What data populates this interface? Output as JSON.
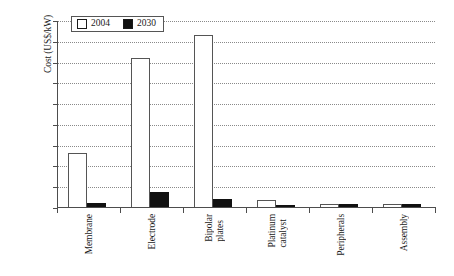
{
  "chart_data": {
    "type": "bar",
    "title": "",
    "xlabel": "",
    "ylabel": "Cost (US$/kW)",
    "ylim": [
      0,
      900
    ],
    "ytick_step": 100,
    "yticks": [
      900,
      800,
      700,
      600,
      500,
      400,
      300,
      200,
      100,
      0
    ],
    "grid": true,
    "legend_position": "top-left",
    "categories": [
      "Membrane",
      "Electrode",
      "Bipolar plates",
      "Platinum catalyst",
      "Peripherals",
      "Assembly"
    ],
    "category_lines": [
      [
        "Membrane"
      ],
      [
        "Electrode"
      ],
      [
        "Bipolar",
        "plates"
      ],
      [
        "Platinum",
        "catalyst"
      ],
      [
        "Peripherals"
      ],
      [
        "Assembly"
      ]
    ],
    "series": [
      {
        "name": "2004",
        "color": "#ffffff",
        "values": [
          255,
          710,
          825,
          30,
          10,
          10
        ]
      },
      {
        "name": "2030",
        "color": "#111111",
        "values": [
          15,
          68,
          35,
          5,
          8,
          8
        ]
      }
    ]
  },
  "legend": {
    "items": [
      {
        "label": "2004",
        "swatch": "open-square-icon"
      },
      {
        "label": "2030",
        "swatch": "filled-square-icon"
      }
    ]
  }
}
